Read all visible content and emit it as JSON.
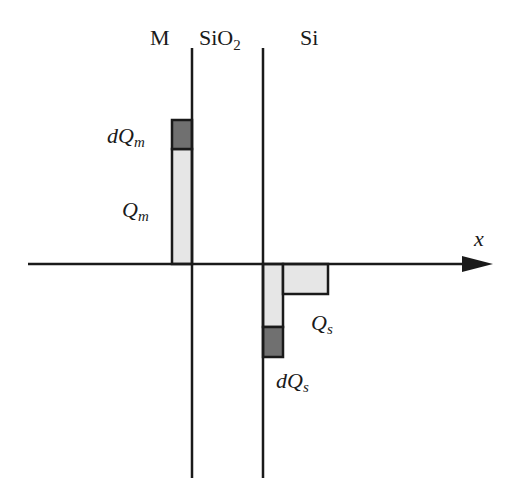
{
  "regions": {
    "metal": "M",
    "oxide_base": "SiO",
    "oxide_sub": "2",
    "semiconductor": "Si"
  },
  "axis": {
    "label": "x"
  },
  "charges": {
    "metal_charge": {
      "base": "Q",
      "sub": "m"
    },
    "metal_delta": {
      "prefix": "d",
      "base": "Q",
      "sub": "m"
    },
    "semi_charge": {
      "base": "Q",
      "sub": "s"
    },
    "semi_delta": {
      "prefix": "d",
      "base": "Q",
      "sub": "s"
    }
  },
  "colors": {
    "line": "#1a1a1a",
    "charge_fill": "#e6e6e6",
    "delta_fill": "#707070",
    "background": "#ffffff"
  }
}
